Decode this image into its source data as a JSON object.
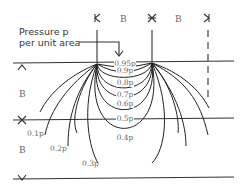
{
  "diagram": {
    "annotation": {
      "line1": "Pressure p",
      "line2": "per unit area"
    },
    "top_markers": [
      {
        "symbol": "K",
        "x": 97
      },
      {
        "symbol": "B",
        "x": 124
      },
      {
        "symbol": "X",
        "x": 152
      },
      {
        "symbol": "B",
        "x": 179
      },
      {
        "symbol": "K",
        "x": 206
      }
    ],
    "left_markers": [
      {
        "symbol": "^",
        "y": 68
      },
      {
        "symbol": "B",
        "y": 94
      },
      {
        "symbol": "X",
        "y": 121
      },
      {
        "symbol": "B",
        "y": 151
      },
      {
        "symbol": "v",
        "y": 179
      }
    ],
    "isobar_labels": [
      {
        "label": "0.95p",
        "x": 122,
        "y": 66
      },
      {
        "label": "0.9p",
        "x": 122,
        "y": 73
      },
      {
        "label": "0.8p",
        "x": 122,
        "y": 85
      },
      {
        "label": "0.7p",
        "x": 122,
        "y": 97
      },
      {
        "label": "0.6p",
        "x": 122,
        "y": 106
      },
      {
        "label": "0.5p",
        "x": 122,
        "y": 121
      },
      {
        "label": "0.4p",
        "x": 122,
        "y": 140
      },
      {
        "label": "0.3p",
        "x": 90,
        "y": 166
      },
      {
        "label": "0.2p",
        "x": 58,
        "y": 151
      },
      {
        "label": "0.1p",
        "x": 29,
        "y": 136
      }
    ],
    "colors": {
      "line": "#333333",
      "label": "#666666",
      "background": "#ffffff"
    }
  }
}
